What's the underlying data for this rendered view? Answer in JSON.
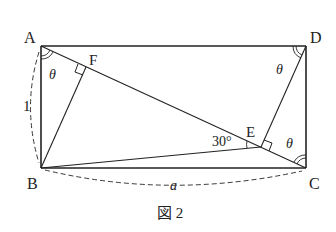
{
  "figure": {
    "caption": "図 2",
    "vertices": {
      "A": "A",
      "B": "B",
      "C": "C",
      "D": "D",
      "E": "E",
      "F": "F"
    },
    "angle_labels": {
      "theta_A": "θ",
      "theta_D": "θ",
      "theta_C": "θ",
      "angle_E": "30°"
    },
    "length_labels": {
      "AB": "1",
      "BC": "a"
    },
    "colors": {
      "line": "#222222",
      "background": "#ffffff"
    }
  }
}
